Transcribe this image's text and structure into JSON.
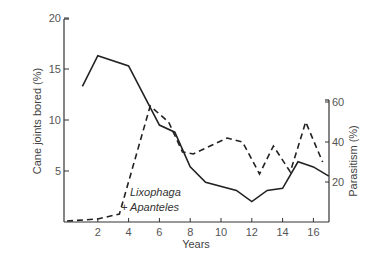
{
  "chart_data": {
    "type": "line",
    "title": "",
    "xlabel": "Years",
    "ylabel": "Cane joints bored (%)",
    "y2label": "Parasitism (%)",
    "xticks": [
      2,
      4,
      6,
      8,
      10,
      12,
      14,
      16
    ],
    "yticks": [
      5,
      10,
      15,
      20
    ],
    "y2ticks": [
      20,
      40,
      60
    ],
    "xlim": [
      0,
      17
    ],
    "ylim": [
      0,
      20
    ],
    "y2lim": [
      0,
      60
    ],
    "grid": false,
    "annotation": {
      "line1": "Lixophaga",
      "line2": "+ Apanteles"
    },
    "series": [
      {
        "name": "Cane joints bored (%)",
        "axis": "left",
        "style": "solid",
        "x": [
          1,
          2,
          4,
          6,
          7,
          8,
          9,
          11,
          12,
          13,
          14,
          15,
          16,
          17
        ],
        "values": [
          13.3,
          16.3,
          15.3,
          9.5,
          8.8,
          5.4,
          3.9,
          3.1,
          2.0,
          3.1,
          3.3,
          5.9,
          5.4,
          4.5
        ]
      },
      {
        "name": "Parasitism (%) - Lixophaga + Apanteles",
        "axis": "right",
        "style": "dashed",
        "x": [
          0,
          2,
          3.4,
          5.4,
          6.6,
          7.5,
          8.2,
          10.4,
          11.4,
          12.5,
          13.4,
          14.5,
          15.5,
          16.6
        ],
        "values": [
          0,
          1.5,
          4,
          58,
          50,
          35,
          34,
          42,
          40,
          24,
          38,
          25,
          50,
          30
        ]
      }
    ]
  }
}
